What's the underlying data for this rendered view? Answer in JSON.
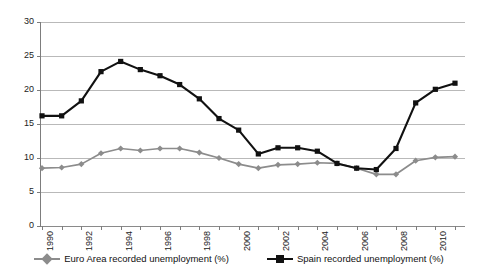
{
  "chart_data": {
    "type": "line",
    "title": "",
    "subtitle": "",
    "xlabel": "",
    "ylabel": "",
    "ylim": [
      0,
      30
    ],
    "yticks": [
      0,
      5,
      10,
      15,
      20,
      25,
      30
    ],
    "grid": true,
    "legend_position": "bottom",
    "x": [
      1990,
      1991,
      1992,
      1993,
      1994,
      1995,
      1996,
      1997,
      1998,
      1999,
      2000,
      2001,
      2002,
      2003,
      2004,
      2005,
      2006,
      2007,
      2008,
      2009,
      2010,
      2011
    ],
    "xtick_labels": [
      "1990",
      "1992",
      "1994",
      "1996",
      "1998",
      "2000",
      "2002",
      "2004",
      "2006",
      "2008",
      "2010"
    ],
    "series": [
      {
        "name": "Euro Area recorded unemployment (%)",
        "color": "#8c8c8c",
        "marker": "diamond",
        "values": [
          8.5,
          8.6,
          9.1,
          10.7,
          11.4,
          11.1,
          11.4,
          11.4,
          10.8,
          10.0,
          9.1,
          8.5,
          9.0,
          9.1,
          9.3,
          9.2,
          8.5,
          7.6,
          7.6,
          9.6,
          10.1,
          10.2
        ]
      },
      {
        "name": "Spain recorded unemployment (%)",
        "color": "#111111",
        "marker": "square",
        "values": [
          16.2,
          16.2,
          18.4,
          22.7,
          24.2,
          23.0,
          22.1,
          20.8,
          18.7,
          15.8,
          14.1,
          10.6,
          11.5,
          11.5,
          11.0,
          9.2,
          8.5,
          8.3,
          11.4,
          18.1,
          20.1,
          21.0
        ]
      }
    ]
  },
  "legend": {
    "items": [
      {
        "label": "Euro Area recorded unemployment (%)",
        "color": "#8c8c8c",
        "marker": "diamond"
      },
      {
        "label": "Spain recorded unemployment (%)",
        "color": "#111111",
        "marker": "square"
      }
    ]
  }
}
